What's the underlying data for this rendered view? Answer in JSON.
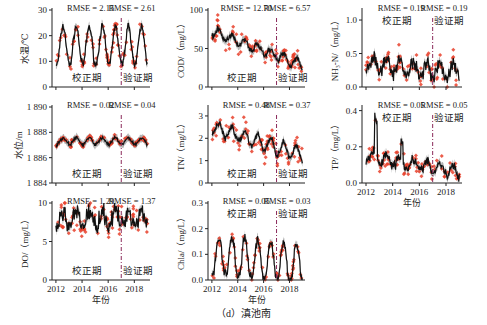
{
  "figure": {
    "caption": "（d）滇池南",
    "shared_xlabel": "年份",
    "calibration_label": "校正期",
    "validation_label": "验证期",
    "split_year": 2017,
    "x_ticks": [
      "2012",
      "2014",
      "2016",
      "2018"
    ],
    "colors": {
      "observed": "#e8402a",
      "simulated_line": "#111111",
      "uncertainty_band": "#9a9a9a",
      "split_line": "#8a2a5a",
      "axis": "#222222"
    }
  },
  "chart_data": [
    {
      "id": "water-temp",
      "type": "line",
      "ylabel": "水温/℃",
      "ylim": [
        0,
        30
      ],
      "yticks": [
        0,
        10,
        20,
        30
      ],
      "ytick_labels": [
        "0",
        "10",
        "20",
        "30"
      ],
      "rmse_calibration": "RMSE = 2.15",
      "rmse_validation": "RMSE = 2.61",
      "period_label_pos": "bottom",
      "show_xtick_labels": false,
      "pattern": "seasonal",
      "params": {
        "mean": 16,
        "amp": 7.5,
        "noise": 1.2,
        "obs_noise": 2.0,
        "trend": 0
      }
    },
    {
      "id": "water-level",
      "type": "line",
      "ylabel": "水位/m",
      "ylim": [
        1884,
        1890
      ],
      "yticks": [
        1884,
        1886,
        1888,
        1890
      ],
      "ytick_labels": [
        "1 884",
        "1 886",
        "1 888",
        "1 890"
      ],
      "rmse_calibration": "RMSE = 0.02",
      "rmse_validation": "RMSE = 0.04",
      "period_label_pos": "bottom",
      "show_xtick_labels": false,
      "pattern": "flat",
      "params": {
        "mean": 1887.3,
        "amp": 0.25,
        "noise": 0.1,
        "obs_noise": 0.12,
        "trend": 0
      }
    },
    {
      "id": "do",
      "type": "line",
      "ylabel": "DO/（mg/L）",
      "ylim": [
        0,
        10
      ],
      "yticks": [
        0,
        5,
        10
      ],
      "ytick_labels": [
        "0",
        "5",
        "10"
      ],
      "rmse_calibration": "RMSE = 1.29",
      "rmse_validation": "RMSE = 1.37",
      "period_label_pos": "bottom",
      "show_xtick_labels": true,
      "pattern": "noisy",
      "params": {
        "mean": 7.8,
        "amp": 0.9,
        "noise": 0.9,
        "obs_noise": 1.2,
        "trend": 0.05
      }
    },
    {
      "id": "cod",
      "type": "line",
      "ylabel": "COD/（mg/L）",
      "ylim": [
        0,
        100
      ],
      "yticks": [
        0,
        50,
        100
      ],
      "ytick_labels": [
        "0",
        "50",
        "100"
      ],
      "rmse_calibration": "RMSE = 12.70",
      "rmse_validation": "RMSE = 6.57",
      "period_label_pos": "bottom",
      "show_xtick_labels": false,
      "pattern": "decline",
      "params": {
        "mean": 72,
        "amp": 6,
        "noise": 3,
        "obs_noise": 10,
        "trend": -6.2
      }
    },
    {
      "id": "tn",
      "type": "line",
      "ylabel": "TN/（mg/L）",
      "ylim": [
        0,
        3.4
      ],
      "yticks": [
        0,
        1,
        2,
        3
      ],
      "ytick_labels": [
        "0",
        "1",
        "2",
        "3"
      ],
      "rmse_calibration": "RMSE = 0.48",
      "rmse_validation": "RMSE = 0.37",
      "period_label_pos": "bottom",
      "show_xtick_labels": false,
      "pattern": "decline",
      "params": {
        "mean": 2.5,
        "amp": 0.3,
        "noise": 0.12,
        "obs_noise": 0.4,
        "trend": -0.18
      }
    },
    {
      "id": "chla",
      "type": "line",
      "ylabel": "Chla/（mg/L）",
      "ylim": [
        0,
        0.3
      ],
      "yticks": [
        0,
        0.1,
        0.2,
        0.3
      ],
      "ytick_labels": [
        "0.0",
        "0.1",
        "0.2",
        "0.3"
      ],
      "rmse_calibration": "RMSE = 0.05",
      "rmse_validation": "RMSE = 0.03",
      "period_label_pos": "top",
      "show_xtick_labels": true,
      "pattern": "bloom",
      "params": {
        "mean": 0.09,
        "amp": 0.08,
        "noise": 0.015,
        "obs_noise": 0.02,
        "trend": -0.004
      }
    },
    {
      "id": "nh3n",
      "type": "line",
      "ylabel": "NH₃-N/（mg/L）",
      "ylim": [
        0,
        1.15
      ],
      "yticks": [
        0,
        0.5,
        1.0
      ],
      "ytick_labels": [
        "0.0",
        "0.5",
        "1.0"
      ],
      "rmse_calibration": "RMSE = 0.19",
      "rmse_validation": "RMSE = 0.19",
      "period_label_pos": "top",
      "show_xtick_labels": false,
      "pattern": "noisy",
      "params": {
        "mean": 0.33,
        "amp": 0.1,
        "noise": 0.08,
        "obs_noise": 0.13,
        "trend": -0.015
      }
    },
    {
      "id": "tp",
      "type": "line",
      "ylabel": "TP/（mg/L）",
      "ylim": [
        0,
        0.42
      ],
      "yticks": [
        0,
        0.2,
        0.4
      ],
      "ytick_labels": [
        "0.0",
        "0.2",
        "0.4"
      ],
      "rmse_calibration": "RMSE = 0.05",
      "rmse_validation": "RMSE = 0.05",
      "period_label_pos": "top",
      "show_xtick_labels": true,
      "pattern": "spiky",
      "params": {
        "mean": 0.15,
        "amp": 0.03,
        "noise": 0.02,
        "obs_noise": 0.04,
        "trend": -0.013
      }
    }
  ]
}
